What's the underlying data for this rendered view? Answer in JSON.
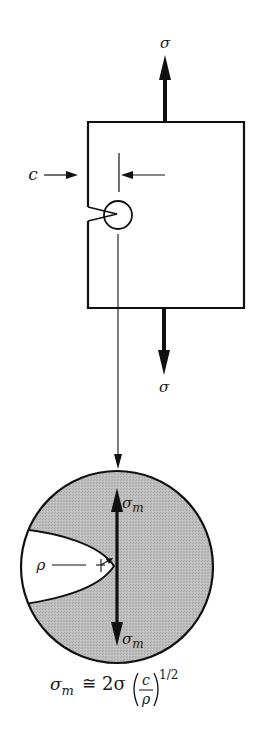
{
  "figure": {
    "type": "stress concentration at crack tip",
    "colors": {
      "ink": "#111111",
      "shade": "#b9b9b9",
      "background": "#ffffff"
    }
  },
  "specimen": {
    "applied_stress_top_label": "σ",
    "applied_stress_bottom_label": "σ",
    "crack_length_label": "c"
  },
  "magnified_view": {
    "radius_label": "ρ",
    "max_stress_top_label": "σ",
    "max_stress_top_sub": "m",
    "max_stress_bottom_label": "σ",
    "max_stress_bottom_sub": "m"
  },
  "formula": {
    "lhs": "σ",
    "lhs_sub": "m",
    "relation": "≅",
    "coefficient": "2σ",
    "numerator": "c",
    "denominator": "ρ",
    "exponent": "1/2"
  }
}
